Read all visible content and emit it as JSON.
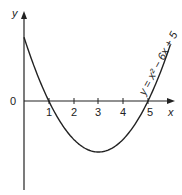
{
  "chart_data": {
    "type": "line",
    "title": "",
    "xlabel": "x",
    "ylabel": "y",
    "origin_label": "0",
    "x_ticks": [
      "1",
      "2",
      "3",
      "4",
      "5"
    ],
    "equation_label": "y = x² − 6x + 5",
    "series": [
      {
        "name": "y = x^2 - 6x + 5",
        "x": [
          0,
          0.5,
          1,
          1.5,
          2,
          2.5,
          3,
          3.5,
          4,
          4.5,
          5,
          5.5,
          5.9
        ],
        "values": [
          5,
          2.25,
          0,
          -1.75,
          -3,
          -3.75,
          -4,
          -3.75,
          -3,
          -1.75,
          0,
          2.25,
          4.41
        ]
      }
    ],
    "roots": [
      1,
      5
    ],
    "vertex": [
      3,
      -4
    ],
    "y_intercept": 5,
    "xlim": [
      0,
      6
    ],
    "ylim": [
      -7,
      7
    ],
    "grid": false,
    "colors": {
      "curve": "#222222",
      "axes": "#222222"
    }
  }
}
